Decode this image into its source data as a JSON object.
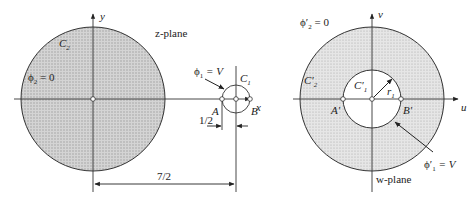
{
  "z_plane": {
    "plane_label": "z-plane",
    "x_axis_label": "x",
    "y_axis_label": "y",
    "large_circle_label": "C",
    "large_circle_sub": "2",
    "large_circle_potential": "ϕ",
    "large_circle_potential_sub": "2",
    "large_circle_potential_value": " = 0",
    "small_circle_label": "C",
    "small_circle_sub": "1",
    "small_circle_potential": "ϕ",
    "small_circle_potential_sub": "1",
    "small_circle_potential_value": " = V",
    "point_a": "A",
    "point_b": "B",
    "dim_small": "1/2",
    "dim_large": "7/2"
  },
  "w_plane": {
    "plane_label": "w-plane",
    "u_axis_label": "u",
    "v_axis_label": "v",
    "outer_circle_label": "C′",
    "outer_circle_sub": "2",
    "outer_potential": "ϕ′",
    "outer_potential_sub": "2",
    "outer_potential_value": " = 0",
    "inner_circle_label": "C′",
    "inner_circle_sub": "1",
    "inner_potential": "ϕ′",
    "inner_potential_sub": "1",
    "inner_potential_value": " = V",
    "radius_label": "r",
    "radius_sub": "1",
    "point_a": "A′",
    "point_b": "B′"
  },
  "colors": {
    "shading": "#c8c8c8",
    "line": "#333333"
  }
}
